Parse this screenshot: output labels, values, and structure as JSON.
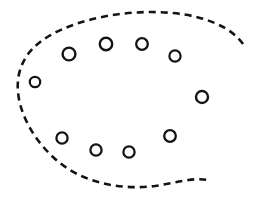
{
  "figure": {
    "width": 257,
    "height": 200,
    "background_color": "#ffffff"
  },
  "boundary": {
    "name": "dashed-open-oval",
    "stroke_color": "#141414",
    "stroke_width": 2.6,
    "dash_length": 7,
    "dash_gap": 5,
    "fill": "none",
    "closed": false,
    "opening_side": "right",
    "path": "M 243 44 C 232 28 206 16 172 13 C 128 9 80 18 49 36 C 25 50 16 70 18 92 C 20 116 36 144 60 163 C 86 184 124 190 155 186 C 175 183 194 177 207 180"
  },
  "nodes": {
    "count": 11,
    "stroke_color": "#141414",
    "fill": "none",
    "items": [
      {
        "id": "ring-1",
        "label": "node-1",
        "cx": 69,
        "cy": 54,
        "r": 6.4,
        "stroke_width": 2.4
      },
      {
        "id": "ring-2",
        "label": "node-2",
        "cx": 106,
        "cy": 44,
        "r": 6.2,
        "stroke_width": 2.4
      },
      {
        "id": "ring-3",
        "label": "node-3",
        "cx": 142,
        "cy": 44,
        "r": 5.8,
        "stroke_width": 2.3
      },
      {
        "id": "ring-4",
        "label": "node-4",
        "cx": 175,
        "cy": 56,
        "r": 5.6,
        "stroke_width": 2.2
      },
      {
        "id": "ring-5",
        "label": "node-5",
        "cx": 35,
        "cy": 82,
        "r": 5.2,
        "stroke_width": 2.2
      },
      {
        "id": "ring-6",
        "label": "node-6",
        "cx": 202,
        "cy": 97,
        "r": 6.0,
        "stroke_width": 2.4
      },
      {
        "id": "ring-7",
        "label": "node-7",
        "cx": 170,
        "cy": 136,
        "r": 5.8,
        "stroke_width": 2.3
      },
      {
        "id": "ring-8",
        "label": "node-8",
        "cx": 62,
        "cy": 138,
        "r": 5.6,
        "stroke_width": 2.3
      },
      {
        "id": "ring-9",
        "label": "node-9",
        "cx": 96,
        "cy": 150,
        "r": 5.6,
        "stroke_width": 2.3
      },
      {
        "id": "ring-10",
        "label": "node-10",
        "cx": 129,
        "cy": 152,
        "r": 5.6,
        "stroke_width": 2.3
      },
      {
        "id": "ring-11",
        "label": "node-11",
        "cx": 243,
        "cy": 44,
        "r": 0.0,
        "stroke_width": 0.0
      }
    ]
  }
}
